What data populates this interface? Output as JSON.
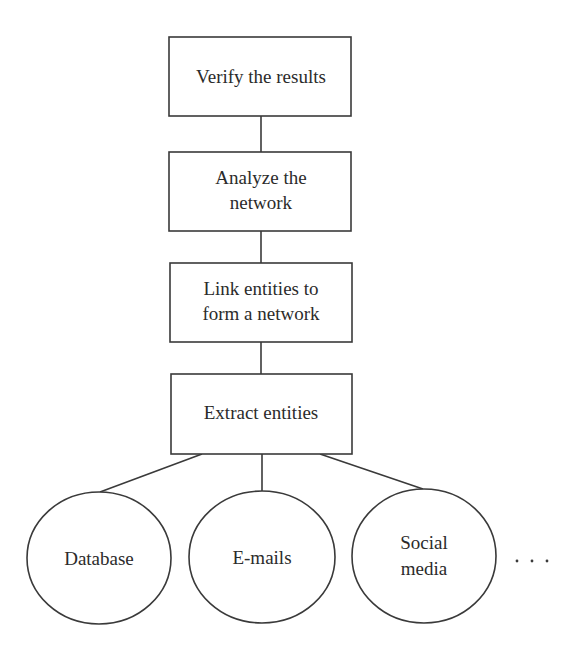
{
  "diagram": {
    "title": "",
    "colors": {
      "stroke": "#3a3a3a",
      "text": "#2b2b2b",
      "background": "#ffffff"
    },
    "steps": [
      {
        "id": "verify",
        "lines": [
          "Verify the results"
        ]
      },
      {
        "id": "analyze",
        "lines": [
          "Analyze the",
          "network"
        ]
      },
      {
        "id": "link",
        "lines": [
          "Link entities to",
          "form a network"
        ]
      },
      {
        "id": "extract",
        "lines": [
          "Extract entities"
        ]
      }
    ],
    "sources": [
      {
        "id": "database",
        "lines": [
          "Database"
        ]
      },
      {
        "id": "emails",
        "lines": [
          "E-mails"
        ]
      },
      {
        "id": "social-media",
        "lines": [
          "Social",
          "media"
        ]
      }
    ],
    "more_sources_indicator": ". . .",
    "edges": [
      {
        "from": "analyze",
        "to": "verify"
      },
      {
        "from": "link",
        "to": "analyze"
      },
      {
        "from": "extract",
        "to": "link"
      },
      {
        "from": "database",
        "to": "extract"
      },
      {
        "from": "emails",
        "to": "extract"
      },
      {
        "from": "social-media",
        "to": "extract"
      }
    ]
  }
}
